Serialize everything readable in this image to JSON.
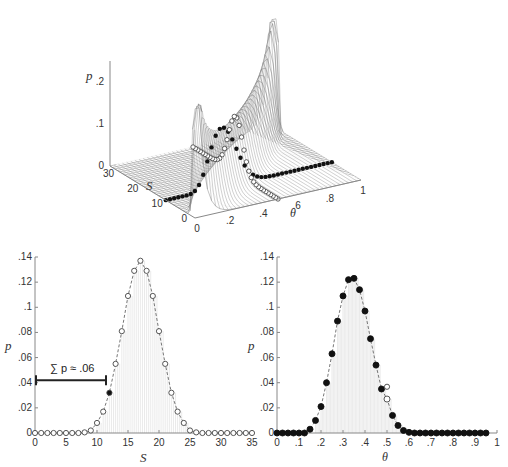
{
  "chart_data": [
    {
      "type": "surface",
      "title": "",
      "xlabel": "θ",
      "ylabel": "S",
      "zlabel": "p",
      "x_ticks": [
        "0",
        ".2",
        ".4",
        ".6",
        ".8",
        "1"
      ],
      "y_ticks": [
        "0",
        "10",
        "20",
        "30"
      ],
      "z_ticks": [
        "0",
        ".1",
        ".2"
      ],
      "annotations": [
        "open circles: slice at θ ≈ .5 along S",
        "filled circles: slice at S = 12 along θ"
      ]
    },
    {
      "type": "line",
      "title": "",
      "xlabel": "S",
      "ylabel": "p",
      "xlim": [
        0,
        35
      ],
      "ylim": [
        0,
        0.14
      ],
      "x_ticks": [
        "0",
        "5",
        "10",
        "15",
        "20",
        "25",
        "30",
        "35"
      ],
      "y_ticks": [
        "0",
        ".02",
        ".04",
        ".06",
        ".08",
        ".1",
        ".12",
        ".14"
      ],
      "annotation": "∑ p ≈ .06",
      "highlight": {
        "x": 12,
        "y": 0.032,
        "marker": "filled"
      },
      "x": [
        0,
        1,
        2,
        3,
        4,
        5,
        6,
        7,
        8,
        9,
        10,
        11,
        12,
        13,
        14,
        15,
        16,
        17,
        18,
        19,
        20,
        21,
        22,
        23,
        24,
        25,
        26,
        27,
        28,
        29,
        30,
        31,
        32,
        33,
        34,
        35
      ],
      "values": [
        0,
        0,
        0,
        0,
        0,
        0,
        0,
        0,
        0.0005,
        0.002,
        0.008,
        0.017,
        0.032,
        0.055,
        0.081,
        0.109,
        0.129,
        0.137,
        0.129,
        0.109,
        0.081,
        0.055,
        0.032,
        0.017,
        0.008,
        0.002,
        0.0005,
        0,
        0,
        0,
        0,
        0,
        0,
        0,
        0,
        0
      ]
    },
    {
      "type": "line",
      "title": "",
      "xlabel": "θ",
      "ylabel": "p",
      "xlim": [
        0,
        1
      ],
      "ylim": [
        0,
        0.14
      ],
      "x_ticks": [
        "0",
        ".1",
        ".2",
        ".3",
        ".4",
        ".5",
        ".6",
        ".7",
        ".8",
        ".9",
        "1"
      ],
      "y_ticks": [
        "0",
        ".02",
        ".04",
        ".06",
        ".08",
        ".1",
        ".12",
        ".14"
      ],
      "highlight": {
        "x": 0.5,
        "y": 0.032,
        "marker": "open"
      },
      "x": [
        0,
        0.025,
        0.05,
        0.075,
        0.1,
        0.125,
        0.15,
        0.175,
        0.2,
        0.225,
        0.25,
        0.275,
        0.3,
        0.325,
        0.35,
        0.375,
        0.4,
        0.425,
        0.45,
        0.475,
        0.5,
        0.525,
        0.55,
        0.575,
        0.6,
        0.625,
        0.65,
        0.675,
        0.7,
        0.725,
        0.75,
        0.775,
        0.8,
        0.825,
        0.85,
        0.875,
        0.9,
        0.925,
        0.95
      ],
      "values": [
        0,
        0,
        0,
        0,
        0,
        0,
        0.003,
        0.01,
        0.021,
        0.04,
        0.063,
        0.089,
        0.109,
        0.122,
        0.123,
        0.114,
        0.097,
        0.075,
        0.054,
        0.035,
        0.027,
        0.014,
        0.006,
        0.002,
        0.0005,
        0,
        0,
        0,
        0,
        0,
        0,
        0,
        0,
        0,
        0,
        0,
        0,
        0,
        0
      ]
    }
  ],
  "labels": {
    "surface_z": "p",
    "surface_y": "S",
    "surface_x": "θ",
    "left_y": "p",
    "left_x": "S",
    "right_y": "p",
    "right_x": "θ",
    "sum_annotation": "∑ p ≈ .06"
  },
  "colors": {
    "axis": "#888888",
    "marker": "#111111",
    "curve": "#777777",
    "grid_fill": "#e8e8e8"
  }
}
